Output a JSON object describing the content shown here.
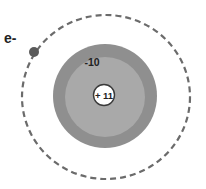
{
  "diagram": {
    "type": "atom-model",
    "colors": {
      "background": "#ffffff",
      "orbit": "#6b6b6b",
      "electron_cloud_outer": "#8f8f8f",
      "electron_cloud_inner": "#a9a9a9",
      "nucleus_fill": "#ffffff",
      "nucleus_stroke": "#3a3a3a",
      "electron": "#5a5a5a",
      "text": "#222222"
    },
    "labels": {
      "electron": "e-",
      "inner_charge": "-10",
      "nucleus_charge": "+ 11"
    }
  }
}
